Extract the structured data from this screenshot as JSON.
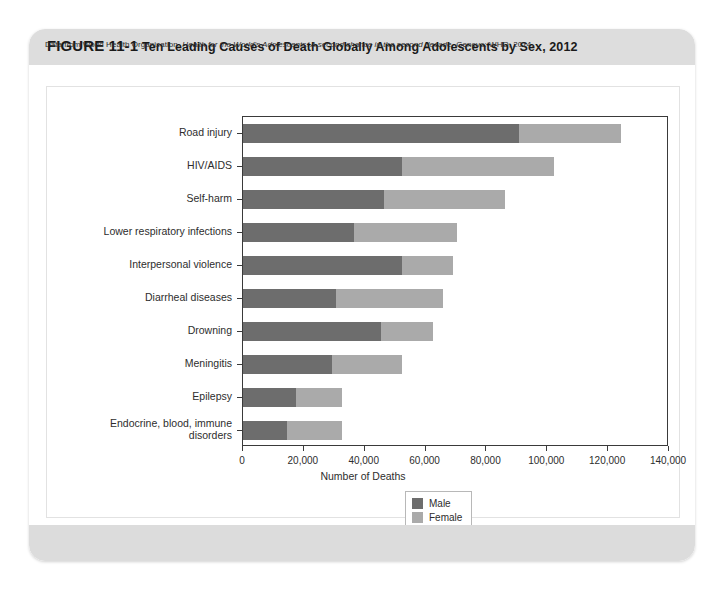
{
  "figure": {
    "number": "FIGURE 11-1",
    "title": "Ten Leading Causes of Death Globally Among Adolescents by Sex, 2012",
    "source_prefix": "Data from World Health Organization. ",
    "source_italic": "Health for the World's Adolescents: A second chance in the second decade.",
    "source_suffix": " Geneva: WHO; 2014."
  },
  "colors": {
    "male": "#6d6d6d",
    "female": "#aaaaaa",
    "header_band": "#dddddd",
    "footer_band": "#dcdcdc",
    "axis": "#3a3a3a"
  },
  "legend": {
    "position": "below-axis-center",
    "items": [
      {
        "label": "Male",
        "color": "#6d6d6d"
      },
      {
        "label": "Female",
        "color": "#aaaaaa"
      }
    ]
  },
  "chart_data": {
    "type": "bar",
    "orientation": "horizontal",
    "stacked": true,
    "title": "Ten Leading Causes of Death Globally Among Adolescents by Sex, 2012",
    "xlabel": "Number of Deaths",
    "ylabel": "",
    "xlim": [
      0,
      140000
    ],
    "xticks": [
      0,
      20000,
      40000,
      60000,
      80000,
      100000,
      120000,
      140000
    ],
    "xticklabels": [
      "0",
      "20,000",
      "40,000",
      "60,000",
      "80,000",
      "100,000",
      "120,000",
      "140,000"
    ],
    "grid": false,
    "legend_entries": [
      "Male",
      "Female"
    ],
    "categories": [
      "Road injury",
      "HIV/AIDS",
      "Self-harm",
      "Lower respiratory infections",
      "Interpersonal violence",
      "Diarrheal diseases",
      "Drowning",
      "Meningitis",
      "Epilepsy",
      "Endocrine, blood, immune\ndisorders"
    ],
    "series": [
      {
        "name": "Male",
        "color": "#6d6d6d",
        "values": [
          90600,
          52400,
          46300,
          36400,
          52400,
          30700,
          45300,
          29300,
          17400,
          14600
        ]
      },
      {
        "name": "Female",
        "color": "#aaaaaa",
        "values": [
          33700,
          49800,
          39900,
          33800,
          16700,
          35000,
          17000,
          22800,
          15000,
          18100
        ]
      }
    ],
    "totals": [
      124300,
      102200,
      86200,
      70200,
      69100,
      65700,
      62300,
      52100,
      32400,
      32700
    ]
  }
}
